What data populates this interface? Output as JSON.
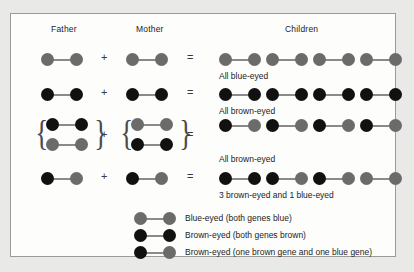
{
  "figure": {
    "columns": {
      "father": "Father",
      "mother": "Mother",
      "children": "Children"
    },
    "operators": {
      "plus": "+",
      "equals": "="
    },
    "brace_open": "{",
    "brace_close": "}"
  },
  "colors": {
    "blue_allele": "#6b6b6b",
    "brown_allele": "#111111",
    "connector": "#8a8a8a",
    "frame_border": "#9a9a98",
    "panel_background": "#fdfdfb",
    "page_background": "#e9e9e7",
    "text": "#1c1c1c"
  },
  "rows": [
    {
      "id": "row-1",
      "father": {
        "type": "single",
        "pairs": [
          [
            "blue",
            "blue"
          ]
        ]
      },
      "mother": {
        "type": "single",
        "pairs": [
          [
            "blue",
            "blue"
          ]
        ]
      },
      "children": [
        [
          "blue",
          "blue"
        ],
        [
          "blue",
          "blue"
        ],
        [
          "blue",
          "blue"
        ],
        [
          "blue",
          "blue"
        ]
      ],
      "caption": "All blue-eyed"
    },
    {
      "id": "row-2",
      "father": {
        "type": "single",
        "pairs": [
          [
            "brown",
            "brown"
          ]
        ]
      },
      "mother": {
        "type": "single",
        "pairs": [
          [
            "brown",
            "brown"
          ]
        ]
      },
      "children": [
        [
          "brown",
          "brown"
        ],
        [
          "brown",
          "brown"
        ],
        [
          "brown",
          "brown"
        ],
        [
          "brown",
          "brown"
        ]
      ],
      "caption": "All brown-eyed"
    },
    {
      "id": "row-3",
      "father": {
        "type": "braced",
        "pairs": [
          [
            "brown",
            "brown"
          ],
          [
            "blue",
            "blue"
          ]
        ]
      },
      "mother": {
        "type": "braced",
        "pairs": [
          [
            "blue",
            "blue"
          ],
          [
            "brown",
            "brown"
          ]
        ]
      },
      "children": [
        [
          "brown",
          "blue"
        ],
        [
          "brown",
          "blue"
        ],
        [
          "brown",
          "blue"
        ],
        [
          "brown",
          "blue"
        ]
      ],
      "caption": "All brown-eyed"
    },
    {
      "id": "row-4",
      "father": {
        "type": "single",
        "pairs": [
          [
            "brown",
            "blue"
          ]
        ]
      },
      "mother": {
        "type": "single",
        "pairs": [
          [
            "brown",
            "blue"
          ]
        ]
      },
      "children": [
        [
          "brown",
          "brown"
        ],
        [
          "brown",
          "blue"
        ],
        [
          "brown",
          "blue"
        ],
        [
          "blue",
          "blue"
        ]
      ],
      "caption": "3 brown-eyed and 1 blue-eyed"
    }
  ],
  "legend": [
    {
      "pair": [
        "blue",
        "blue"
      ],
      "label": "Blue-eyed (both genes blue)"
    },
    {
      "pair": [
        "brown",
        "brown"
      ],
      "label": "Brown-eyed (both genes brown)"
    },
    {
      "pair": [
        "brown",
        "blue"
      ],
      "label": "Brown-eyed (one brown gene and one blue gene)"
    }
  ]
}
